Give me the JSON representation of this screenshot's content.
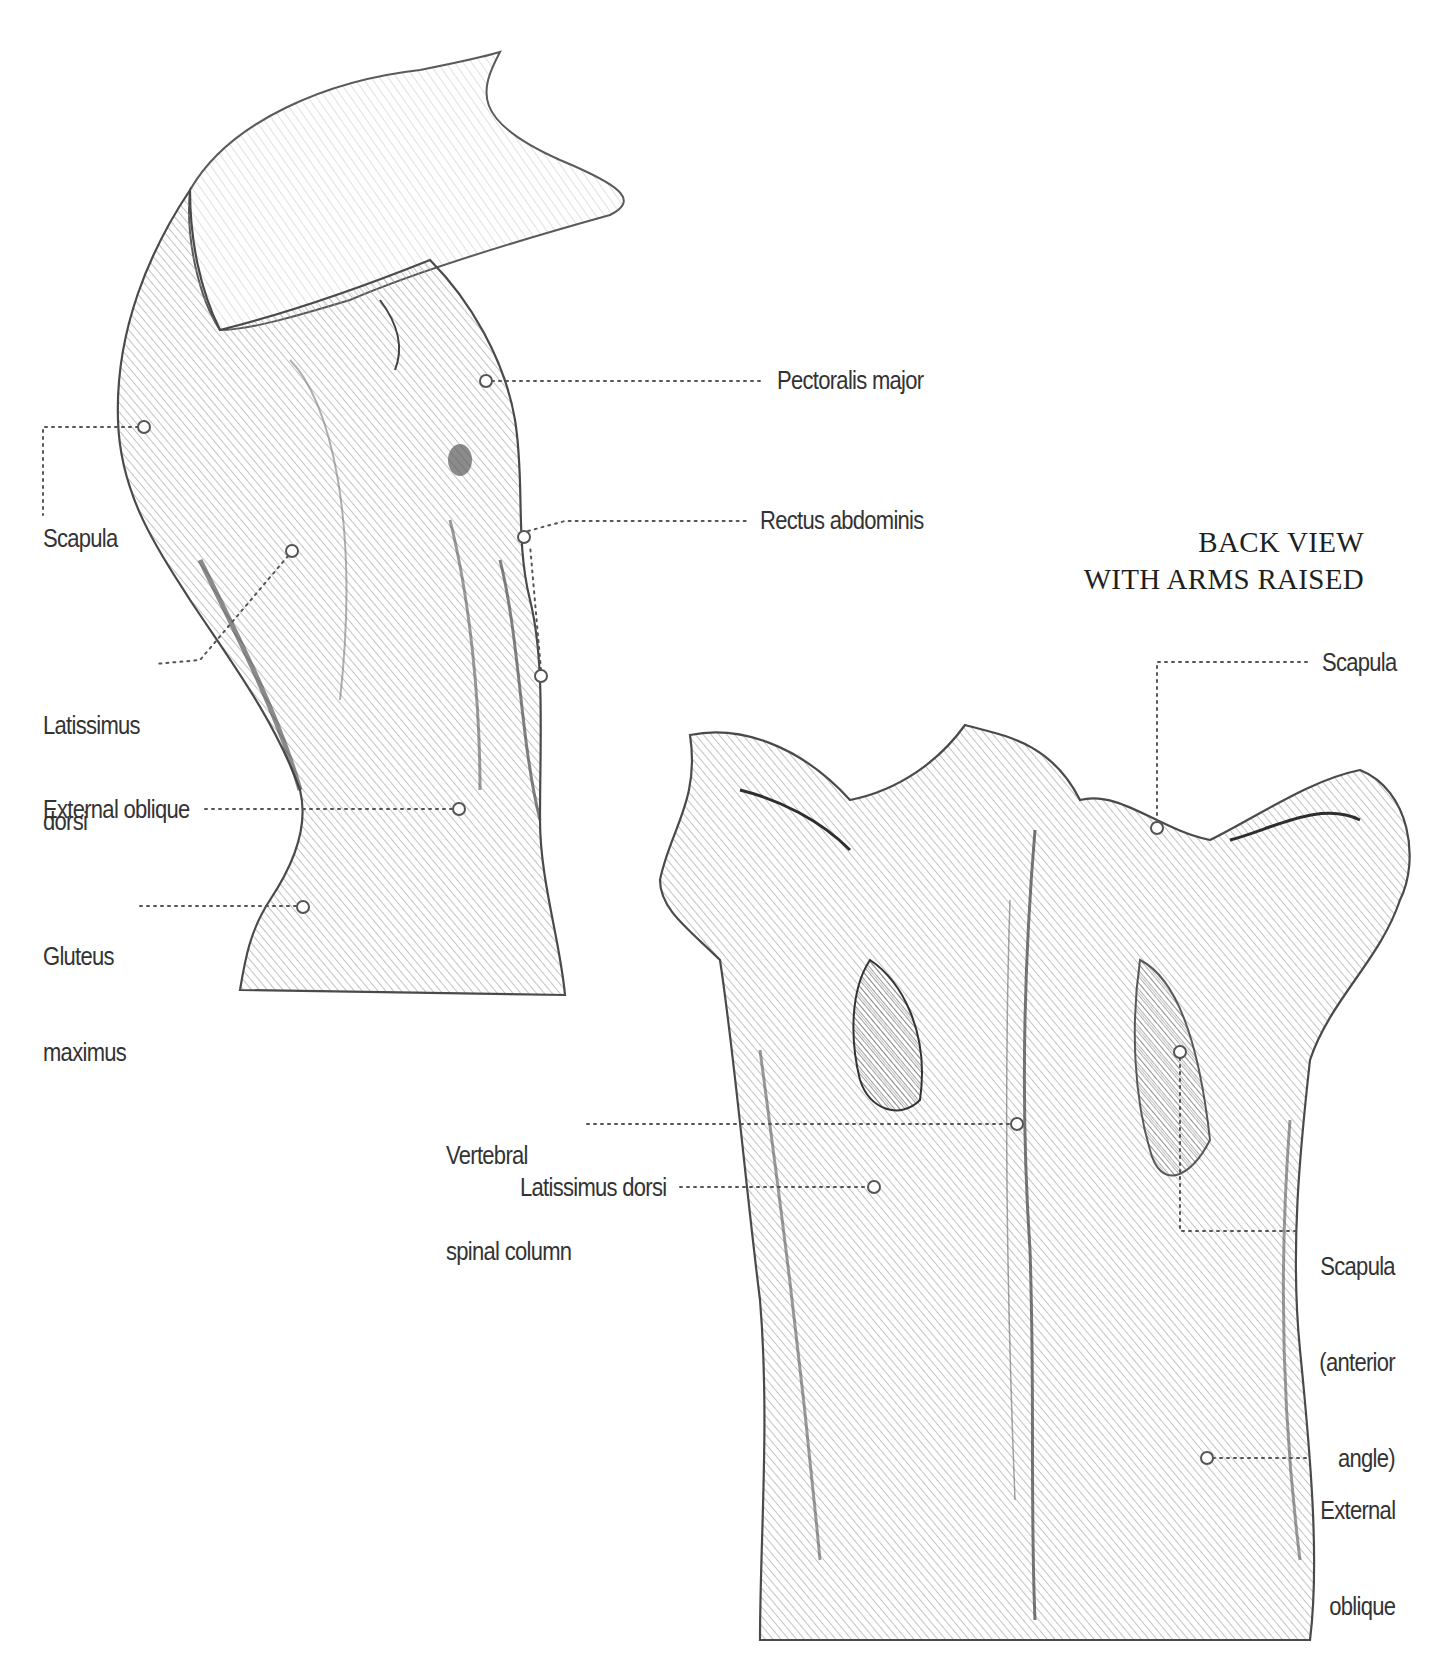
{
  "figure": {
    "top_title_cropped": "SIDE VIEW WITH ARMS RAISED",
    "back_view_title": {
      "line1": "BACK VIEW",
      "line2": "WITH ARMS RAISED"
    },
    "colors": {
      "background": "#ffffff",
      "text": "#333333",
      "leader_line": "#555555",
      "pencil_dark": "#4a4a4a",
      "pencil_mid": "#8a8a8a",
      "pencil_light": "#c8c8c8"
    },
    "side_view_labels": [
      {
        "id": "pectoralis-major",
        "text": "Pectoralis major"
      },
      {
        "id": "scapula",
        "text": "Scapula"
      },
      {
        "id": "rectus-abdominis",
        "text": "Rectus abdominis"
      },
      {
        "id": "latissimus-dorsi",
        "line1": "Latissimus",
        "line2": "dorsi"
      },
      {
        "id": "external-oblique",
        "text": "External oblique"
      },
      {
        "id": "gluteus-maximus",
        "line1": "Gluteus",
        "line2": "maximus"
      }
    ],
    "back_view_labels": [
      {
        "id": "scapula",
        "text": "Scapula"
      },
      {
        "id": "vertebral-spinal-column",
        "line1": "Vertebral",
        "line2": "spinal column"
      },
      {
        "id": "latissimus-dorsi",
        "text": "Latissimus dorsi"
      },
      {
        "id": "scapula-anterior-angle",
        "line1": "Scapula",
        "line2": "(anterior",
        "line3": "angle)"
      },
      {
        "id": "external-oblique",
        "line1": "External",
        "line2": "oblique"
      }
    ]
  }
}
